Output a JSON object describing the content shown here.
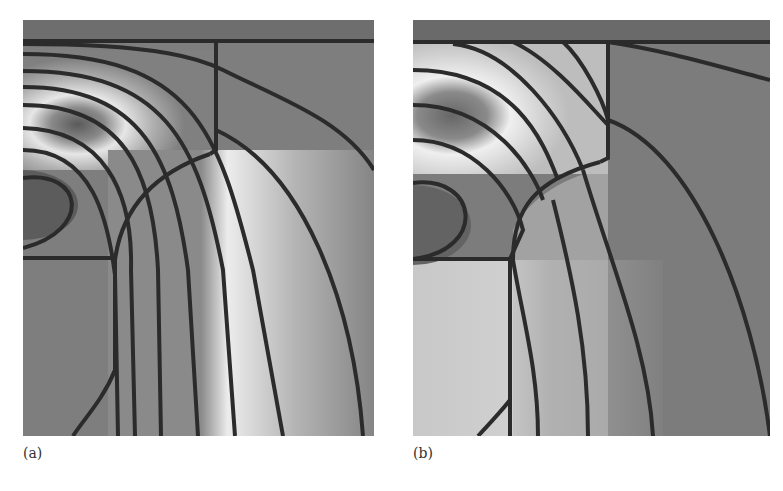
{
  "figure": {
    "panels": [
      {
        "id": "a",
        "label": "(a)"
      },
      {
        "id": "b",
        "label": "(b)"
      }
    ],
    "colors": {
      "background_field": "#7a7a7a",
      "contour_line": "#2a2a2a",
      "bright_region": "#e8e8e8",
      "dark_region": "#5e5e5e"
    }
  }
}
